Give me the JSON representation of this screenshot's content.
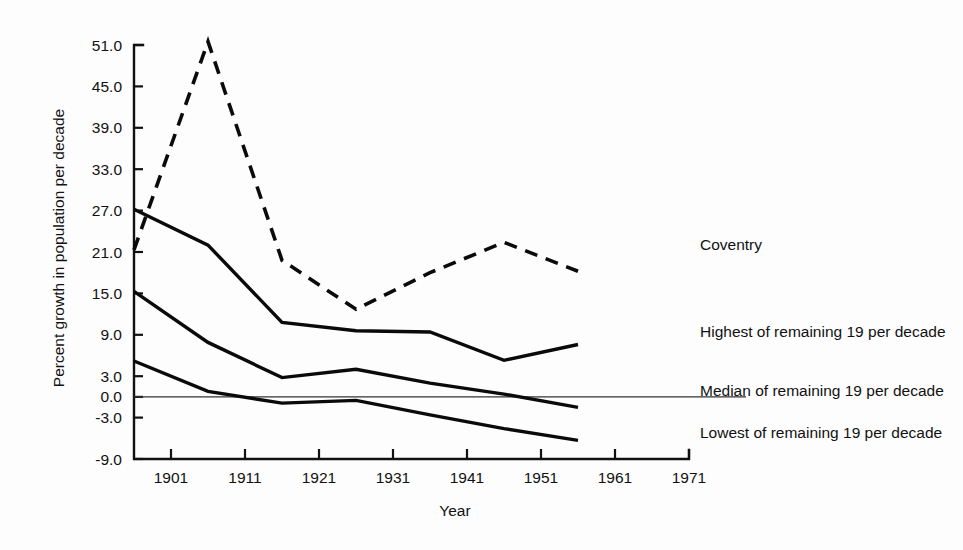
{
  "chart_data": {
    "type": "line",
    "title": "",
    "xlabel": "Year",
    "ylabel": "Percent growth in population per decade",
    "xlim": [
      1896,
      1971
    ],
    "ylim": [
      -9.0,
      51.0
    ],
    "grid": false,
    "legend_position": "inline-right-of-line-ends",
    "x_tick_labels": [
      "1901",
      "1911",
      "1921",
      "1931",
      "1941",
      "1951",
      "1961",
      "1971"
    ],
    "x_ticks": [
      1901,
      1911,
      1921,
      1931,
      1941,
      1951,
      1961,
      1971
    ],
    "y_tick_labels": [
      "51.0",
      "45.0",
      "39.0",
      "33.0",
      "27.0",
      "21.0",
      "15.0",
      "9.0",
      "3.0",
      "0.0",
      "-3.0",
      "-9.0"
    ],
    "y_ticks": [
      51.0,
      45.0,
      39.0,
      33.0,
      27.0,
      21.0,
      15.0,
      9.0,
      3.0,
      0.0,
      -3.0,
      -9.0
    ],
    "x": [
      1896,
      1906,
      1916,
      1926,
      1936,
      1946,
      1956
    ],
    "series": [
      {
        "name": "Coventry",
        "label": "Coventry",
        "style": "dashed",
        "values": [
          21.3,
          51.5,
          19.8,
          12.7,
          18.0,
          22.4,
          18.2
        ]
      },
      {
        "name": "Highest of remaining 19 per decade",
        "label": "Highest of remaining 19 per decade",
        "style": "solid",
        "values": [
          27.2,
          22.0,
          10.8,
          9.6,
          9.4,
          5.3,
          7.6
        ]
      },
      {
        "name": "Median of remaining 19 per decade",
        "label": "Median of remaining 19 per decade",
        "style": "solid",
        "values": [
          15.3,
          7.9,
          2.8,
          4.0,
          2.0,
          0.4,
          -1.5
        ]
      },
      {
        "name": "Lowest of remaining 19 per decade",
        "label": "Lowest of remaining 19 per decade",
        "style": "solid",
        "values": [
          5.2,
          0.8,
          -0.9,
          -0.5,
          -2.6,
          -4.6,
          -6.3
        ]
      }
    ],
    "zero_reference_line": 0.0
  }
}
